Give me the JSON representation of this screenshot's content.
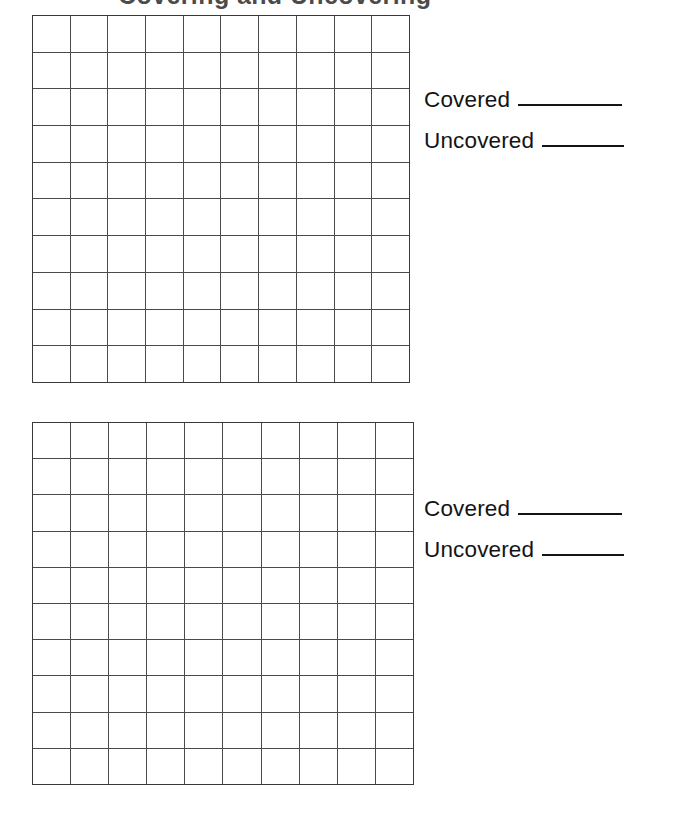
{
  "worksheet": {
    "title_remnant": "Covering and Uncovering",
    "background_color": "#ffffff",
    "ink_color": "#141414",
    "grid_line_color": "#4a4a4a",
    "sections": [
      {
        "id": "section-1",
        "grid": {
          "name": "hundred-grid-1",
          "columns": 10,
          "rows": 10,
          "total_cells": 100,
          "filled_cells": 0
        },
        "answers": [
          {
            "label": "Covered",
            "value": "",
            "blank_style": "long"
          },
          {
            "label": "Uncovered",
            "value": "",
            "blank_style": "short"
          }
        ]
      },
      {
        "id": "section-2",
        "grid": {
          "name": "hundred-grid-2",
          "columns": 10,
          "rows": 10,
          "total_cells": 100,
          "filled_cells": 0
        },
        "answers": [
          {
            "label": "Covered",
            "value": "",
            "blank_style": "long"
          },
          {
            "label": "Uncovered",
            "value": "",
            "blank_style": "short"
          }
        ]
      }
    ]
  }
}
